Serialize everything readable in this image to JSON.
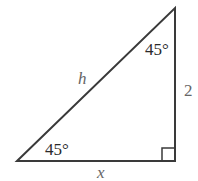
{
  "diagram": {
    "type": "right-triangle",
    "vertices": {
      "bottom_left": [
        17,
        161
      ],
      "top_right": [
        175,
        8
      ],
      "bottom_right": [
        175,
        161
      ]
    },
    "labels": {
      "top_angle": "45°",
      "bottom_angle": "45°",
      "hypotenuse": "h",
      "vertical_side": "2",
      "base": "x"
    },
    "right_angle_marker": true,
    "colors": {
      "stroke": "#3a3a3a",
      "background": "#ffffff"
    }
  }
}
